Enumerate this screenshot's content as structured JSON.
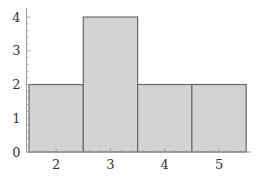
{
  "chart_data": {
    "type": "bar",
    "title": "",
    "xlabel": "",
    "ylabel": "",
    "categories": [
      "2",
      "3",
      "4",
      "5"
    ],
    "values": [
      2,
      4,
      2,
      2
    ],
    "ylim": [
      0,
      4
    ],
    "xlim": [
      1.5,
      5.6
    ],
    "yticks": [
      "0",
      "1",
      "2",
      "3",
      "4"
    ],
    "xticks": [
      "2",
      "3",
      "4",
      "5"
    ],
    "grid": false,
    "legend": null,
    "bar_width": 1,
    "colors": {
      "fill": "#d3d3d3",
      "edge": "#6a6a6a",
      "axis": "#999999",
      "text": "#333333"
    }
  }
}
